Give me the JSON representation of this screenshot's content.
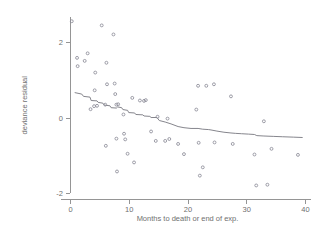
{
  "chart_data": {
    "type": "scatter",
    "title": "",
    "xlabel": "Months to death or end of exp.",
    "ylabel": "deviance residual",
    "xlim": [
      -1.5,
      41
    ],
    "ylim": [
      -2.35,
      2.65
    ],
    "xticks": [
      0,
      10,
      20,
      30,
      40
    ],
    "xticklabels": [
      "0",
      "10",
      "20",
      "30",
      "40"
    ],
    "yticks": [
      2,
      0,
      -2
    ],
    "yticklabels": [
      "2",
      "0",
      "-2"
    ],
    "grid": false,
    "legend": null,
    "marker": "open-circle",
    "point_color": "#8c8c98",
    "line_color": "#77777f",
    "axis_color": "#8a8a8a",
    "text_color": "#6f6f6f",
    "background": "#ffffff",
    "points": [
      [
        0.3,
        2.55
      ],
      [
        1.2,
        1.58
      ],
      [
        1.3,
        1.36
      ],
      [
        2.5,
        1.5
      ],
      [
        3.0,
        1.7
      ],
      [
        4.3,
        1.19
      ],
      [
        5.4,
        2.44
      ],
      [
        6.2,
        1.45
      ],
      [
        6.3,
        0.88
      ],
      [
        7.4,
        2.2
      ],
      [
        7.6,
        0.9
      ],
      [
        7.7,
        0.62
      ],
      [
        4.2,
        0.72
      ],
      [
        3.5,
        0.22
      ],
      [
        4.1,
        0.3
      ],
      [
        4.6,
        0.31
      ],
      [
        6.0,
        0.34
      ],
      [
        7.9,
        0.34
      ],
      [
        8.2,
        0.35
      ],
      [
        9.1,
        0.08
      ],
      [
        10.6,
        0.52
      ],
      [
        11.9,
        0.45
      ],
      [
        12.6,
        0.44
      ],
      [
        12.9,
        0.46
      ],
      [
        14.9,
        0.02
      ],
      [
        16.6,
        -0.03
      ],
      [
        7.9,
        -0.56
      ],
      [
        9.2,
        -0.43
      ],
      [
        9.4,
        -0.58
      ],
      [
        6.1,
        -0.75
      ],
      [
        8.0,
        -1.43
      ],
      [
        9.8,
        -0.96
      ],
      [
        10.9,
        -1.19
      ],
      [
        13.8,
        -0.37
      ],
      [
        14.6,
        -0.62
      ],
      [
        16.2,
        -0.62
      ],
      [
        16.9,
        -0.57
      ],
      [
        18.4,
        -0.7
      ],
      [
        19.4,
        -0.97
      ],
      [
        21.8,
        0.84
      ],
      [
        23.2,
        0.84
      ],
      [
        24.5,
        0.88
      ],
      [
        21.5,
        0.21
      ],
      [
        21.9,
        -0.67
      ],
      [
        22.1,
        -1.54
      ],
      [
        22.6,
        -1.32
      ],
      [
        24.6,
        -0.66
      ],
      [
        27.4,
        0.56
      ],
      [
        27.7,
        -0.7
      ],
      [
        31.4,
        -0.98
      ],
      [
        31.7,
        -1.8
      ],
      [
        33.0,
        -0.1
      ],
      [
        33.6,
        -1.78
      ],
      [
        34.3,
        -0.83
      ],
      [
        38.8,
        -0.99
      ]
    ],
    "fit_line": [
      [
        0.8,
        0.66
      ],
      [
        2.0,
        0.62
      ],
      [
        2.3,
        0.56
      ],
      [
        3.4,
        0.54
      ],
      [
        3.6,
        0.45
      ],
      [
        4.6,
        0.44
      ],
      [
        4.8,
        0.4
      ],
      [
        5.6,
        0.38
      ],
      [
        5.8,
        0.33
      ],
      [
        6.8,
        0.31
      ],
      [
        7.0,
        0.26
      ],
      [
        7.9,
        0.25
      ],
      [
        8.1,
        0.28
      ],
      [
        8.8,
        0.26
      ],
      [
        9.0,
        0.21
      ],
      [
        9.8,
        0.19
      ],
      [
        10.0,
        0.13
      ],
      [
        11.0,
        0.12
      ],
      [
        11.2,
        0.08
      ],
      [
        12.4,
        0.07
      ],
      [
        12.6,
        0.04
      ],
      [
        13.6,
        0.03
      ],
      [
        13.8,
        0.0
      ],
      [
        14.8,
        0.0
      ],
      [
        15.2,
        -0.08
      ],
      [
        16.2,
        -0.12
      ],
      [
        17.2,
        -0.17
      ],
      [
        18.4,
        -0.24
      ],
      [
        19.4,
        -0.27
      ],
      [
        20.6,
        -0.29
      ],
      [
        21.8,
        -0.29
      ],
      [
        22.6,
        -0.31
      ],
      [
        23.6,
        -0.32
      ],
      [
        24.0,
        -0.33
      ],
      [
        25.0,
        -0.36
      ],
      [
        26.2,
        -0.39
      ],
      [
        27.4,
        -0.41
      ],
      [
        28.2,
        -0.42
      ],
      [
        29.2,
        -0.43
      ],
      [
        30.4,
        -0.44
      ],
      [
        31.4,
        -0.45
      ],
      [
        31.8,
        -0.48
      ],
      [
        33.0,
        -0.49
      ],
      [
        34.6,
        -0.5
      ],
      [
        36.2,
        -0.51
      ],
      [
        38.0,
        -0.52
      ],
      [
        39.6,
        -0.53
      ]
    ]
  }
}
